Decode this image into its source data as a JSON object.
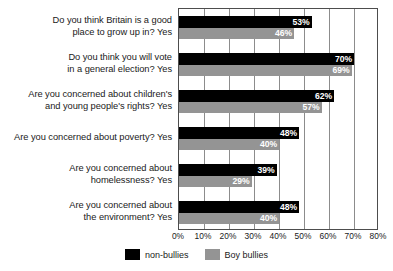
{
  "chart_data": {
    "type": "bar",
    "orientation": "horizontal",
    "title": "",
    "xlabel": "",
    "ylabel": "",
    "xlim": [
      0,
      80
    ],
    "xticks": [
      "0%",
      "10%",
      "20%",
      "30%",
      "40%",
      "50%",
      "60%",
      "70%",
      "80%"
    ],
    "xtick_values": [
      0,
      10,
      20,
      30,
      40,
      50,
      60,
      70,
      80
    ],
    "grid": true,
    "legend_position": "bottom-center",
    "categories": [
      "Do you think Britain is a good\nplace to grow up in? Yes",
      "Do you think you will vote\nin a general election? Yes",
      "Are you concerned about children's\nand young people's rights? Yes",
      "Are you concerned about poverty? Yes",
      "Are you concerned about\nhomelessness? Yes",
      "Are you concerned about\nthe environment? Yes"
    ],
    "series": [
      {
        "name": "non-bullies",
        "color": "#000000",
        "values": [
          53,
          70,
          62,
          48,
          39,
          48
        ],
        "labels": [
          "53%",
          "70%",
          "62%",
          "48%",
          "39%",
          "48%"
        ]
      },
      {
        "name": "Boy bullies",
        "color": "#949494",
        "values": [
          46,
          69,
          57,
          40,
          29,
          40
        ],
        "labels": [
          "46%",
          "69%",
          "57%",
          "40%",
          "29%",
          "40%"
        ]
      }
    ]
  }
}
